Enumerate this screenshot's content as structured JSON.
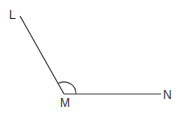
{
  "diagram": {
    "type": "angle",
    "points": {
      "L": {
        "label": "L",
        "x": 20,
        "y": 16
      },
      "M": {
        "label": "M",
        "x": 64,
        "y": 94
      },
      "N": {
        "label": "N",
        "x": 161,
        "y": 94
      }
    },
    "angle_marked": "LMN",
    "colors": {
      "line": "#444444",
      "label": "#333333"
    }
  }
}
